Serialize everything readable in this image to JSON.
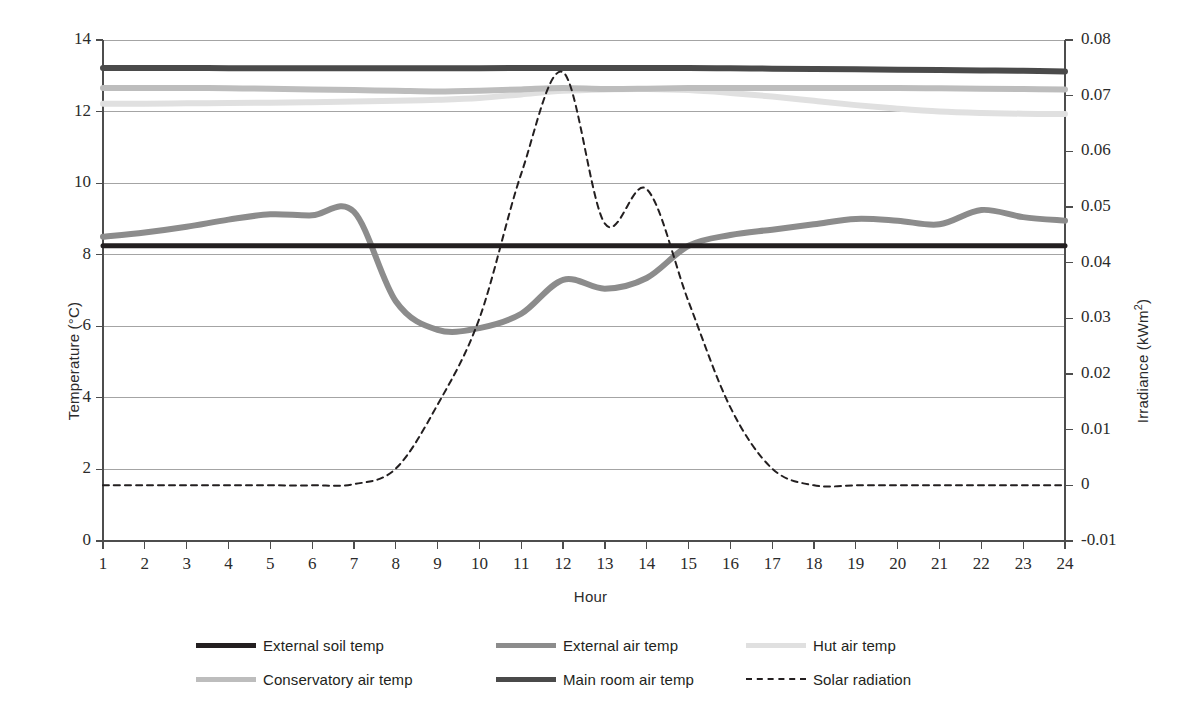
{
  "chart_data": {
    "type": "line",
    "title": "",
    "xlabel": "Hour",
    "ylabel": "Temperature (°C)",
    "y2label": "Irradiance (kWm²)",
    "xlim": [
      1,
      24
    ],
    "ylim": [
      0,
      14
    ],
    "y2lim": [
      -0.01,
      0.08
    ],
    "grid": true,
    "legend_position": "bottom",
    "x": [
      1,
      2,
      3,
      4,
      5,
      6,
      7,
      8,
      9,
      10,
      11,
      12,
      13,
      14,
      15,
      16,
      17,
      18,
      19,
      20,
      21,
      22,
      23,
      24
    ],
    "xticks": [
      "1",
      "2",
      "3",
      "4",
      "5",
      "6",
      "7",
      "8",
      "9",
      "10",
      "11",
      "12",
      "13",
      "14",
      "15",
      "16",
      "17",
      "18",
      "19",
      "20",
      "21",
      "22",
      "23",
      "24"
    ],
    "yticks": [
      "0",
      "2",
      "4",
      "6",
      "8",
      "10",
      "12",
      "14"
    ],
    "y2ticks": [
      "-0.01",
      "0",
      "0.01",
      "0.02",
      "0.03",
      "0.04",
      "0.05",
      "0.06",
      "0.07",
      "0.08"
    ],
    "series": [
      {
        "name": "External soil temp",
        "axis": "left",
        "color": "#231f20",
        "width": 5,
        "dash": "solid",
        "values": [
          8.25,
          8.25,
          8.25,
          8.25,
          8.25,
          8.25,
          8.25,
          8.25,
          8.25,
          8.25,
          8.25,
          8.25,
          8.25,
          8.25,
          8.25,
          8.25,
          8.25,
          8.25,
          8.25,
          8.25,
          8.25,
          8.25,
          8.25,
          8.25
        ]
      },
      {
        "name": "External air temp",
        "axis": "left",
        "color": "#8c8c8c",
        "width": 6,
        "dash": "solid",
        "values": [
          8.5,
          8.62,
          8.78,
          8.98,
          9.13,
          9.1,
          9.2,
          6.7,
          5.9,
          5.95,
          6.35,
          7.3,
          7.05,
          7.35,
          8.25,
          8.55,
          8.7,
          8.85,
          9.0,
          8.95,
          8.85,
          9.25,
          9.05,
          8.95
        ]
      },
      {
        "name": "Hut air temp",
        "axis": "left",
        "color": "#e0e0e0",
        "width": 6,
        "dash": "solid",
        "values": [
          12.22,
          12.22,
          12.23,
          12.24,
          12.25,
          12.26,
          12.28,
          12.3,
          12.33,
          12.38,
          12.48,
          12.58,
          12.62,
          12.63,
          12.6,
          12.52,
          12.42,
          12.3,
          12.18,
          12.08,
          12.0,
          11.96,
          11.94,
          11.93
        ]
      },
      {
        "name": "Conservatory air temp",
        "axis": "left",
        "color": "#bdbdbd",
        "width": 6,
        "dash": "solid",
        "values": [
          12.66,
          12.66,
          12.66,
          12.65,
          12.64,
          12.62,
          12.6,
          12.58,
          12.56,
          12.58,
          12.62,
          12.66,
          12.63,
          12.64,
          12.66,
          12.66,
          12.66,
          12.66,
          12.66,
          12.66,
          12.65,
          12.64,
          12.63,
          12.62
        ]
      },
      {
        "name": "Main room air temp",
        "axis": "left",
        "color": "#4a4a4a",
        "width": 6,
        "dash": "solid",
        "values": [
          13.22,
          13.22,
          13.22,
          13.21,
          13.21,
          13.21,
          13.21,
          13.21,
          13.21,
          13.21,
          13.22,
          13.22,
          13.22,
          13.22,
          13.22,
          13.21,
          13.2,
          13.19,
          13.18,
          13.17,
          13.16,
          13.15,
          13.14,
          13.12
        ]
      },
      {
        "name": "Solar radiation",
        "axis": "right",
        "color": "#231f20",
        "width": 2,
        "dash": "dashed",
        "values": [
          0.0,
          0.0,
          0.0,
          0.0,
          0.0,
          0.0,
          0.0002,
          0.003,
          0.0145,
          0.03,
          0.056,
          0.0742,
          0.047,
          0.0532,
          0.033,
          0.014,
          0.003,
          0.0,
          0.0,
          0.0,
          0.0,
          0.0,
          0.0,
          0.0
        ]
      }
    ]
  },
  "legend": {
    "entries": [
      {
        "label": "External soil temp",
        "color": "#231f20",
        "dash": "solid",
        "width": 5
      },
      {
        "label": "External air temp",
        "color": "#8c8c8c",
        "dash": "solid",
        "width": 5
      },
      {
        "label": "Hut air temp",
        "color": "#e0e0e0",
        "dash": "solid",
        "width": 5
      },
      {
        "label": "Conservatory air temp",
        "color": "#bdbdbd",
        "dash": "solid",
        "width": 5
      },
      {
        "label": "Main room air temp",
        "color": "#4a4a4a",
        "dash": "solid",
        "width": 5
      },
      {
        "label": "Solar radiation",
        "color": "#231f20",
        "dash": "dashed",
        "width": 2
      }
    ]
  },
  "colors": {
    "axis": "#4d4d4d",
    "grid": "#9a9a9a",
    "text": "#2b2b2b",
    "background": "#ffffff"
  }
}
